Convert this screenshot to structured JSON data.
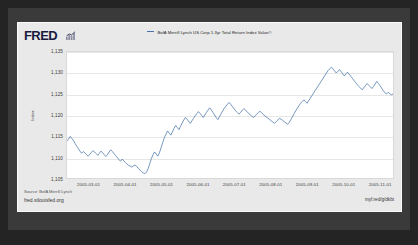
{
  "branding": {
    "logo_text": "FRED",
    "logo_mark_icon": "mini-bar-chart-icon"
  },
  "legend": {
    "entries": [
      {
        "label": "BofA Merrill Lynch US Corp 1-3yr Total Return Index Value©",
        "color": "#4572a7"
      }
    ]
  },
  "footer": {
    "source": "Source: BofA Merrill Lynch",
    "site_url": "fred.stlouisfed.org",
    "short_link": "myf.red/g/dkbt"
  },
  "chart_data": {
    "type": "line",
    "title": "",
    "subtitle": "",
    "xlabel": "",
    "ylabel": "Index",
    "grid": true,
    "legend_position": "top-center",
    "line_color": "#4572a7",
    "ylim": [
      1105,
      1135
    ],
    "yticks": [
      1135,
      1130,
      1125,
      1120,
      1115,
      1110,
      1105
    ],
    "ytick_labels": [
      "1,135",
      "1,130",
      "1,125",
      "1,120",
      "1,115",
      "1,110",
      "1,105"
    ],
    "xlim": [
      "2005-02-01",
      "2005-11-15"
    ],
    "xticks": [
      "2005-03-01",
      "2005-04-01",
      "2005-05-01",
      "2005-06-01",
      "2005-07-01",
      "2005-08-01",
      "2005-09-01",
      "2005-10-01",
      "2005-11-01"
    ],
    "xtick_labels": [
      "2005-03-01",
      "2005-04-01",
      "2005-05-01",
      "2005-06-01",
      "2005-07-01",
      "2005-08-01",
      "2005-09-01",
      "2005-10-01",
      "2005-11-01"
    ],
    "series": [
      {
        "name": "BofA Merrill Lynch US Corp 1-3yr Total Return Index Value©",
        "color": "#4572a7",
        "values": [
          1113.8,
          1114.3,
          1114.9,
          1114.4,
          1113.9,
          1113.2,
          1112.6,
          1112.0,
          1111.4,
          1110.9,
          1111.3,
          1111.0,
          1110.6,
          1110.2,
          1110.6,
          1111.1,
          1111.5,
          1111.2,
          1110.8,
          1110.4,
          1110.9,
          1111.4,
          1111.0,
          1110.5,
          1110.1,
          1110.6,
          1111.2,
          1111.7,
          1111.3,
          1110.8,
          1110.3,
          1109.9,
          1109.4,
          1109.0,
          1109.5,
          1109.1,
          1108.7,
          1108.3,
          1108.0,
          1107.8,
          1107.6,
          1107.9,
          1108.1,
          1107.7,
          1107.3,
          1106.9,
          1106.5,
          1106.2,
          1106.0,
          1106.4,
          1107.2,
          1108.4,
          1109.6,
          1110.5,
          1111.2,
          1110.7,
          1110.2,
          1111.0,
          1112.2,
          1113.4,
          1114.6,
          1115.4,
          1116.2,
          1115.7,
          1115.2,
          1116.0,
          1116.8,
          1117.5,
          1117.0,
          1116.5,
          1117.3,
          1118.1,
          1118.8,
          1119.4,
          1119.0,
          1118.5,
          1118.0,
          1118.6,
          1119.2,
          1119.8,
          1120.3,
          1120.8,
          1120.4,
          1119.9,
          1119.4,
          1120.0,
          1120.6,
          1121.2,
          1121.7,
          1121.2,
          1120.6,
          1120.0,
          1119.4,
          1118.9,
          1119.6,
          1120.3,
          1121.0,
          1121.6,
          1122.1,
          1122.6,
          1123.0,
          1122.5,
          1122.0,
          1121.5,
          1121.0,
          1120.6,
          1120.2,
          1120.6,
          1121.1,
          1121.5,
          1121.2,
          1120.8,
          1120.4,
          1120.0,
          1119.7,
          1119.4,
          1119.8,
          1120.2,
          1120.6,
          1120.9,
          1120.5,
          1120.1,
          1119.8,
          1119.5,
          1119.2,
          1118.9,
          1118.6,
          1118.3,
          1118.0,
          1118.4,
          1118.8,
          1119.2,
          1119.0,
          1118.7,
          1118.4,
          1118.1,
          1117.8,
          1118.2,
          1118.9,
          1119.6,
          1120.3,
          1121.0,
          1121.6,
          1122.2,
          1122.8,
          1123.2,
          1123.6,
          1123.2,
          1122.8,
          1123.4,
          1124.0,
          1124.6,
          1125.2,
          1125.8,
          1126.4,
          1127.0,
          1127.6,
          1128.2,
          1128.8,
          1129.4,
          1130.0,
          1130.6,
          1131.0,
          1131.4,
          1131.0,
          1130.5,
          1130.0,
          1130.4,
          1130.8,
          1130.3,
          1129.8,
          1129.3,
          1129.8,
          1130.2,
          1129.7,
          1129.2,
          1128.7,
          1128.2,
          1127.7,
          1127.2,
          1126.8,
          1126.4,
          1126.0,
          1126.5,
          1127.0,
          1127.5,
          1127.1,
          1126.7,
          1126.3,
          1126.8,
          1127.4,
          1128.0,
          1127.5,
          1127.0,
          1126.4,
          1125.8,
          1125.3,
          1125.0,
          1125.4,
          1125.1,
          1124.8,
          1125.0
        ]
      }
    ]
  }
}
